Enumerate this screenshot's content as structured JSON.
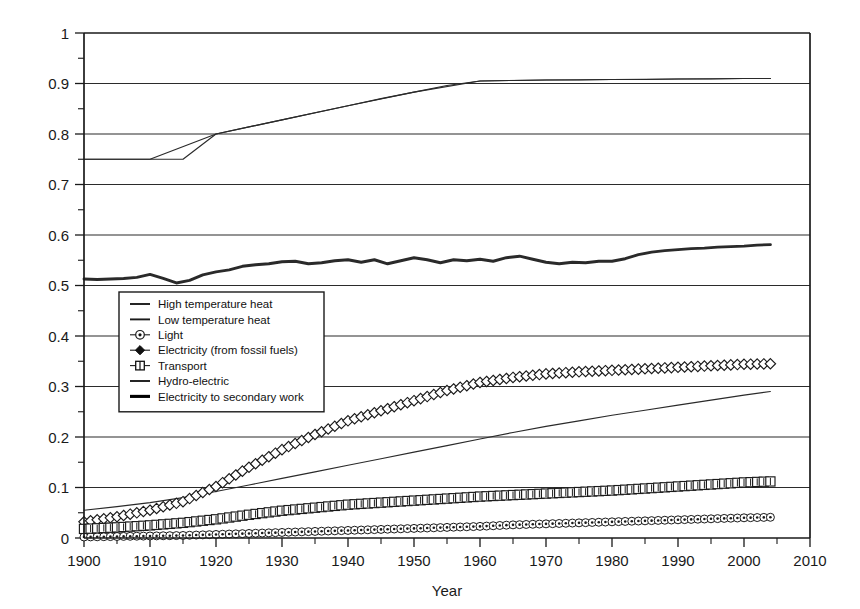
{
  "chart_data": {
    "type": "line",
    "title": "",
    "xlabel": "Year",
    "ylabel": "",
    "xlim": [
      1900,
      2010
    ],
    "ylim": [
      0,
      1
    ],
    "grid": true,
    "legend_position": "center-left",
    "x_ticks": [
      "1900",
      "1910",
      "1920",
      "1930",
      "1940",
      "1950",
      "1960",
      "1970",
      "1980",
      "1990",
      "2000",
      "2010"
    ],
    "y_ticks": [
      "0",
      "0.1",
      "0.2",
      "0.3",
      "0.4",
      "0.5",
      "0.6",
      "0.7",
      "0.8",
      "0.9",
      "1"
    ],
    "minor_y_tick_step": 0.05,
    "series": [
      {
        "name": "High temperature heat",
        "marker": "none",
        "line": "thin",
        "color": "#2a2a2a",
        "x": [
          1900,
          1905,
          1910,
          1915,
          1920,
          1925,
          1930,
          1935,
          1940,
          1945,
          1950,
          1955,
          1960,
          1965,
          1970,
          1975,
          1980,
          1985,
          1990,
          1995,
          2000,
          2004
        ],
        "values": [
          0.75,
          0.75,
          0.75,
          0.75,
          0.8,
          0.814,
          0.828,
          0.842,
          0.856,
          0.87,
          0.883,
          0.896,
          0.905,
          0.906,
          0.907,
          0.907,
          0.908,
          0.908,
          0.909,
          0.909,
          0.91,
          0.91
        ]
      },
      {
        "name": "Low temperature heat",
        "marker": "none",
        "line": "thin",
        "color": "#2a2a2a",
        "x": [
          1900,
          1905,
          1910,
          1915,
          1920,
          1925,
          1930,
          1935,
          1940,
          1945,
          1950,
          1955,
          1960,
          1965,
          1970,
          1975,
          1980,
          1985,
          1990,
          1995,
          2000,
          2004
        ],
        "values": [
          0.055,
          0.062,
          0.07,
          0.08,
          0.092,
          0.105,
          0.118,
          0.131,
          0.144,
          0.157,
          0.17,
          0.183,
          0.196,
          0.209,
          0.221,
          0.232,
          0.243,
          0.253,
          0.263,
          0.273,
          0.283,
          0.29
        ]
      },
      {
        "name": "Light",
        "marker": "circle-open",
        "line": "thin",
        "color": "#2a2a2a",
        "x": [
          1900,
          1905,
          1910,
          1915,
          1920,
          1925,
          1930,
          1935,
          1940,
          1945,
          1950,
          1955,
          1960,
          1965,
          1970,
          1975,
          1980,
          1985,
          1990,
          1995,
          2000,
          2004
        ],
        "values": [
          0.002,
          0.003,
          0.004,
          0.005,
          0.007,
          0.009,
          0.011,
          0.013,
          0.015,
          0.017,
          0.019,
          0.021,
          0.023,
          0.026,
          0.028,
          0.03,
          0.032,
          0.034,
          0.036,
          0.038,
          0.04,
          0.041
        ]
      },
      {
        "name": "Electricity (from fossil fuels)",
        "marker": "diamond-open",
        "line": "thin",
        "color": "#2a2a2a",
        "x": [
          1900,
          1905,
          1910,
          1915,
          1920,
          1925,
          1930,
          1935,
          1940,
          1945,
          1950,
          1955,
          1960,
          1965,
          1970,
          1975,
          1980,
          1985,
          1990,
          1995,
          2000,
          2004
        ],
        "values": [
          0.032,
          0.042,
          0.055,
          0.072,
          0.102,
          0.14,
          0.175,
          0.205,
          0.232,
          0.252,
          0.272,
          0.292,
          0.308,
          0.318,
          0.325,
          0.329,
          0.332,
          0.335,
          0.338,
          0.341,
          0.344,
          0.345
        ]
      },
      {
        "name": "Transport",
        "marker": "square-plus",
        "line": "thin",
        "color": "#2a2a2a",
        "x": [
          1900,
          1905,
          1910,
          1915,
          1920,
          1925,
          1930,
          1935,
          1940,
          1945,
          1950,
          1955,
          1960,
          1965,
          1970,
          1975,
          1980,
          1985,
          1990,
          1995,
          2000,
          2004
        ],
        "values": [
          0.018,
          0.021,
          0.025,
          0.03,
          0.037,
          0.046,
          0.054,
          0.06,
          0.066,
          0.07,
          0.074,
          0.078,
          0.082,
          0.085,
          0.088,
          0.091,
          0.094,
          0.098,
          0.102,
          0.106,
          0.11,
          0.112
        ]
      },
      {
        "name": "Hydro-electric",
        "marker": "none",
        "line": "thin",
        "color": "#2a2a2a",
        "x": [
          1900,
          1910,
          1920,
          1930,
          1940,
          1950,
          1960,
          1970,
          1980,
          1990,
          2000,
          2004
        ],
        "values": [
          0.75,
          0.75,
          0.8,
          0.828,
          0.856,
          0.883,
          0.905,
          0.907,
          0.908,
          0.909,
          0.91,
          0.91
        ]
      },
      {
        "name": "Electricity to secondary work",
        "marker": "none",
        "line": "thick",
        "color": "#000000",
        "x": [
          1900,
          1902,
          1904,
          1906,
          1908,
          1910,
          1912,
          1914,
          1916,
          1918,
          1920,
          1922,
          1924,
          1926,
          1928,
          1930,
          1932,
          1934,
          1936,
          1938,
          1940,
          1942,
          1944,
          1946,
          1948,
          1950,
          1952,
          1954,
          1956,
          1958,
          1960,
          1962,
          1964,
          1966,
          1968,
          1970,
          1972,
          1974,
          1976,
          1978,
          1980,
          1982,
          1984,
          1986,
          1988,
          1990,
          1992,
          1994,
          1996,
          1998,
          2000,
          2002,
          2004
        ],
        "values": [
          0.513,
          0.512,
          0.513,
          0.514,
          0.516,
          0.522,
          0.514,
          0.505,
          0.51,
          0.521,
          0.527,
          0.531,
          0.538,
          0.541,
          0.543,
          0.547,
          0.548,
          0.543,
          0.545,
          0.549,
          0.551,
          0.546,
          0.551,
          0.543,
          0.549,
          0.555,
          0.551,
          0.545,
          0.551,
          0.549,
          0.552,
          0.548,
          0.555,
          0.558,
          0.552,
          0.546,
          0.543,
          0.546,
          0.545,
          0.548,
          0.548,
          0.553,
          0.561,
          0.566,
          0.569,
          0.571,
          0.573,
          0.574,
          0.576,
          0.577,
          0.578,
          0.58,
          0.581
        ]
      }
    ]
  },
  "legend": {
    "items": [
      {
        "label": "High temperature heat",
        "marker": "line-thin"
      },
      {
        "label": "Low temperature heat",
        "marker": "line-thin"
      },
      {
        "label": "Light",
        "marker": "circle-open"
      },
      {
        "label": "Electricity (from fossil fuels)",
        "marker": "diamond-filled"
      },
      {
        "label": "Transport",
        "marker": "square-plus"
      },
      {
        "label": "Hydro-electric",
        "marker": "line-thin"
      },
      {
        "label": "Electricity to secondary work",
        "marker": "line-thick"
      }
    ]
  },
  "colors": {
    "axis": "#1a1a1a",
    "grid": "#2b2b2b",
    "series": "#2a2a2a",
    "thick_series": "#000000",
    "background": "#ffffff"
  }
}
